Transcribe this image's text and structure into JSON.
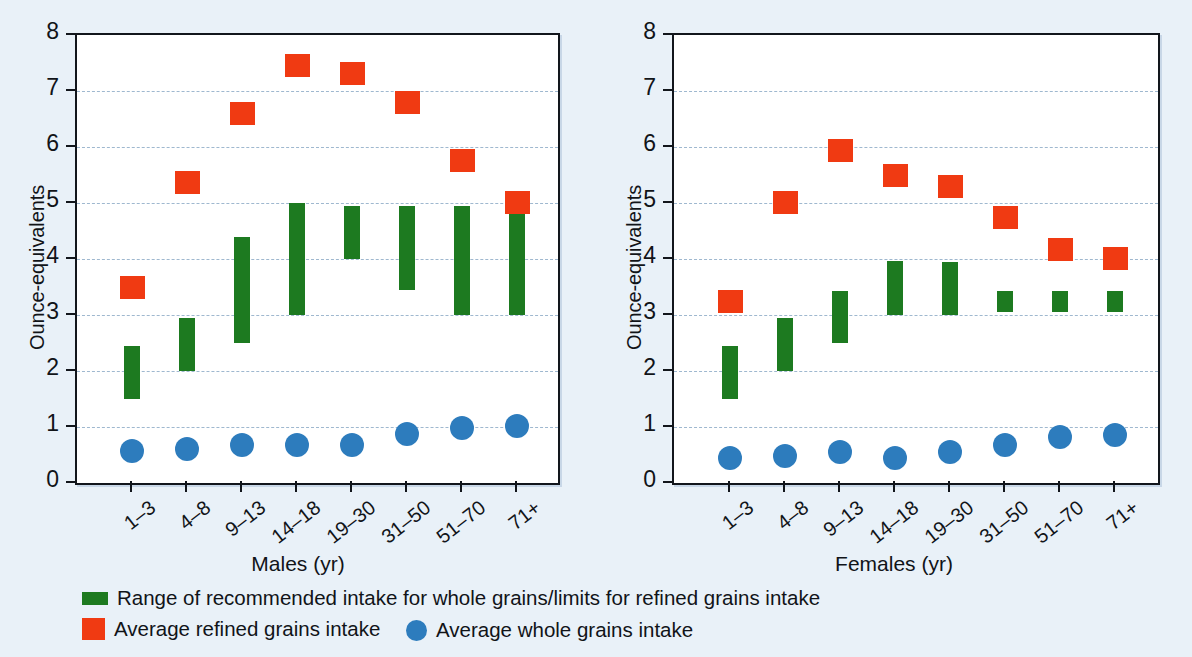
{
  "figure": {
    "background_color": "#e9f1f8",
    "plot_background_color": "#ffffff",
    "axis_color": "#12161c",
    "gridline_color": "#9fb8cf"
  },
  "legend": {
    "items": [
      {
        "marker": "green-bar-swatch",
        "color": "#1d7a20",
        "label": "Range of recommended intake for whole grains/limits for refined grains intake"
      },
      {
        "marker": "orange-square-swatch",
        "color": "#f03a12",
        "label": "Average refined grains intake"
      },
      {
        "marker": "blue-circle-swatch",
        "color": "#2d7cbd",
        "label": "Average whole grains intake"
      }
    ]
  },
  "chart_data": [
    {
      "type": "scatter",
      "panel": "males",
      "title": "",
      "xlabel": "Males (yr)",
      "ylabel": "Ounce-equivalents",
      "ylim": [
        0,
        8
      ],
      "yticks": [
        0,
        1,
        2,
        3,
        4,
        5,
        6,
        7,
        8
      ],
      "ytick_labels": [
        "0",
        "1",
        "2",
        "3",
        "4",
        "5",
        "6",
        "7",
        "8"
      ],
      "grid": true,
      "grid_axis": "y",
      "legend_position": "below-figure",
      "categories": [
        "1–3",
        "4–8",
        "9–13",
        "14–18",
        "19–30",
        "31–50",
        "51–70",
        "71+"
      ],
      "series": [
        {
          "name": "Range of recommended intake for whole grains/limits for refined grains intake",
          "type": "range-bar",
          "color": "#1d7a20",
          "low": [
            1.5,
            2.0,
            2.5,
            3.0,
            4.0,
            3.45,
            3.0,
            3.0
          ],
          "high": [
            2.45,
            2.95,
            4.4,
            5.0,
            4.95,
            4.95,
            4.95,
            4.85
          ]
        },
        {
          "name": "Average refined grains intake",
          "type": "square-marker",
          "color": "#f03a12",
          "values": [
            3.5,
            5.37,
            6.6,
            7.47,
            7.33,
            6.8,
            5.77,
            5.02
          ]
        },
        {
          "name": "Average whole grains intake",
          "type": "circle-marker",
          "color": "#2d7cbd",
          "values": [
            0.58,
            0.6,
            0.68,
            0.68,
            0.67,
            0.87,
            0.98,
            1.02
          ]
        }
      ]
    },
    {
      "type": "scatter",
      "panel": "females",
      "title": "",
      "xlabel": "Females (yr)",
      "ylabel": "Ounce-equivalents",
      "ylim": [
        0,
        8
      ],
      "yticks": [
        0,
        1,
        2,
        3,
        4,
        5,
        6,
        7,
        8
      ],
      "ytick_labels": [
        "0",
        "1",
        "2",
        "3",
        "4",
        "5",
        "6",
        "7",
        "8"
      ],
      "grid": true,
      "grid_axis": "y",
      "legend_position": "below-figure",
      "categories": [
        "1–3",
        "4–8",
        "9–13",
        "14–18",
        "19–30",
        "31–50",
        "51–70",
        "71+"
      ],
      "series": [
        {
          "name": "Range of recommended intake for whole grains/limits for refined grains intake",
          "type": "range-bar",
          "color": "#1d7a20",
          "low": [
            1.5,
            2.0,
            2.5,
            3.0,
            3.0,
            3.05,
            3.05,
            3.05
          ],
          "high": [
            2.45,
            2.95,
            3.42,
            3.97,
            3.95,
            3.42,
            3.42,
            3.42
          ]
        },
        {
          "name": "Average refined grains intake",
          "type": "square-marker",
          "color": "#f03a12",
          "values": [
            3.25,
            5.02,
            5.95,
            5.5,
            5.3,
            4.75,
            4.17,
            4.02
          ]
        },
        {
          "name": "Average whole grains intake",
          "type": "circle-marker",
          "color": "#2d7cbd",
          "values": [
            0.45,
            0.48,
            0.56,
            0.45,
            0.56,
            0.68,
            0.83,
            0.85
          ]
        }
      ]
    }
  ]
}
